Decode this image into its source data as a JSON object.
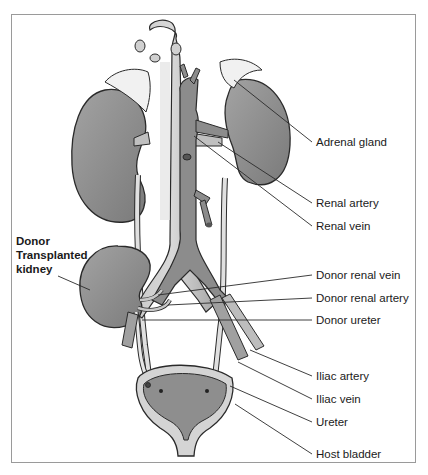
{
  "diagram": {
    "type": "anatomical-illustration",
    "labels_right": [
      {
        "id": "adrenal_gland",
        "text": "Adrenal gland"
      },
      {
        "id": "renal_artery",
        "text": "Renal artery"
      },
      {
        "id": "renal_vein",
        "text": "Renal vein"
      },
      {
        "id": "donor_renal_vein",
        "text": "Donor renal vein"
      },
      {
        "id": "donor_renal_artery",
        "text": "Donor renal artery"
      },
      {
        "id": "donor_ureter",
        "text": "Donor ureter"
      },
      {
        "id": "iliac_artery",
        "text": "Iliac artery"
      },
      {
        "id": "iliac_vein",
        "text": "Iliac vein"
      },
      {
        "id": "ureter",
        "text": "Ureter"
      },
      {
        "id": "host_bladder",
        "text": "Host bladder"
      }
    ],
    "labels_left": [
      {
        "id": "donor_kidney",
        "lines": [
          "Donor",
          "Transplanted",
          "kidney"
        ]
      }
    ],
    "colors": {
      "organ_fill": "#8a8a8a",
      "vessel_fill": "#b9b9b9",
      "adrenal_fill": "#f1f1f1",
      "outline": "#2a2a2a",
      "frame": "#9a9a9a"
    }
  }
}
